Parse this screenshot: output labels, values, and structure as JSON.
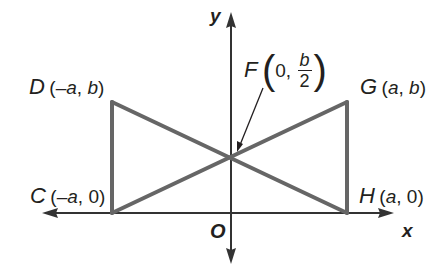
{
  "colors": {
    "background": "#ffffff",
    "figure_stroke": "#666666",
    "axis_stroke": "#333333",
    "text": "#231f20"
  },
  "axes": {
    "x_label": "x",
    "y_label": "y",
    "origin_label": "O"
  },
  "points": {
    "D": {
      "name": "D",
      "coords_open": "(",
      "x": "–a",
      "sep": ", ",
      "y": "b",
      "coords_close": ")"
    },
    "G": {
      "name": "G",
      "coords_open": "(",
      "x": "a",
      "sep": ", ",
      "y": "b",
      "coords_close": ")"
    },
    "C": {
      "name": "C",
      "coords_open": "(",
      "x": "–a",
      "sep": ", ",
      "y": "0",
      "coords_close": ")"
    },
    "H": {
      "name": "H",
      "coords_open": "(",
      "x": "a",
      "sep": ", ",
      "y": "0",
      "coords_close": ")"
    },
    "F": {
      "name": "F",
      "x": "0,",
      "y_num": "b",
      "y_den": "2",
      "open": "(",
      "close": ")"
    }
  },
  "segments": [
    "CD",
    "GH",
    "DH",
    "CG"
  ],
  "pointer": {
    "from": "F label",
    "to": "F"
  }
}
